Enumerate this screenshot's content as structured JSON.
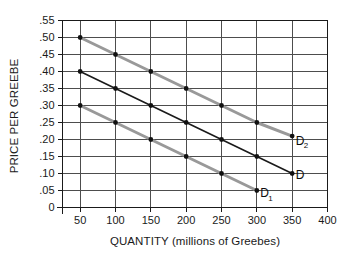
{
  "chart_data": {
    "type": "line",
    "title": "",
    "xlabel": "QUANTITY (millions of Greebes)",
    "ylabel": "PRICE PER GREEBE",
    "xlim": [
      0,
      400
    ],
    "ylim": [
      0,
      0.55
    ],
    "grid": true,
    "legend_position": "inline-right",
    "x_ticks": [
      50,
      100,
      150,
      200,
      250,
      300,
      350,
      400
    ],
    "x_tick_labels": [
      "50",
      "100",
      "150",
      "200",
      "250",
      "300",
      "350",
      "400"
    ],
    "y_ticks": [
      0,
      0.05,
      0.1,
      0.15,
      0.2,
      0.25,
      0.3,
      0.35,
      0.4,
      0.45,
      0.5,
      0.55
    ],
    "y_tick_labels": [
      "0",
      ".05",
      ".10",
      ".15",
      ".20",
      ".25",
      ".30",
      ".35",
      ".40",
      ".45",
      ".50",
      ".55"
    ],
    "series": [
      {
        "name": "D2",
        "label": "D",
        "label_sub": "2",
        "color": "#999999",
        "marker_color": "#111111",
        "x": [
          50,
          100,
          150,
          200,
          250,
          300,
          350
        ],
        "values": [
          0.5,
          0.45,
          0.4,
          0.35,
          0.3,
          0.25,
          0.21
        ]
      },
      {
        "name": "D",
        "label": "D",
        "label_sub": "",
        "color": "#1a1a1a",
        "marker_color": "#111111",
        "x": [
          50,
          100,
          150,
          200,
          250,
          300,
          350
        ],
        "values": [
          0.4,
          0.35,
          0.3,
          0.25,
          0.2,
          0.15,
          0.1
        ]
      },
      {
        "name": "D1",
        "label": "D",
        "label_sub": "1",
        "color": "#999999",
        "marker_color": "#111111",
        "x": [
          50,
          100,
          150,
          200,
          250,
          300
        ],
        "values": [
          0.3,
          0.25,
          0.2,
          0.15,
          0.1,
          0.05
        ]
      }
    ],
    "annotations": [
      {
        "text": "D",
        "sub": "2",
        "x": 355,
        "y": 0.185
      },
      {
        "text": "D",
        "sub": "",
        "x": 355,
        "y": 0.085
      },
      {
        "text": "D",
        "sub": "1",
        "x": 305,
        "y": 0.03
      }
    ]
  },
  "colors": {
    "grid": "#4d4d4d",
    "axis": "#1a1a1a",
    "gray_curve": "#999999",
    "black_curve": "#1a1a1a",
    "marker": "#111111",
    "text": "#1a1a1a",
    "background": "#ffffff"
  }
}
